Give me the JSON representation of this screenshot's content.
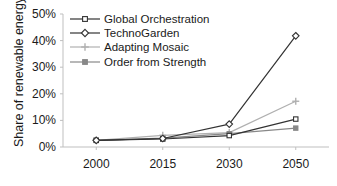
{
  "chart_data": {
    "type": "line",
    "title": "",
    "xlabel": "",
    "ylabel": "Share of renewable energy",
    "categories": [
      "2000",
      "2015",
      "2030",
      "2050"
    ],
    "ylim": [
      0,
      50
    ],
    "yticks": [
      "0%",
      "10%",
      "20%",
      "30%",
      "40%",
      "50%"
    ],
    "ytick_values": [
      0,
      10,
      20,
      30,
      40,
      50
    ],
    "grid": false,
    "legend_position": "top-left",
    "series": [
      {
        "name": "Global Orchestration",
        "marker": "open-square",
        "color": "#333333",
        "values": [
          2.5,
          3.0,
          4.3,
          10.5
        ]
      },
      {
        "name": "TechnoGarden",
        "marker": "open-diamond",
        "color": "#333333",
        "values": [
          2.5,
          3.2,
          8.6,
          41.8
        ]
      },
      {
        "name": "Adapting Mosaic",
        "marker": "plus",
        "color": "#b0b0b0",
        "values": [
          2.5,
          4.4,
          5.4,
          17.2
        ]
      },
      {
        "name": "Order from Strength",
        "marker": "filled-square",
        "color": "#888888",
        "values": [
          2.5,
          3.3,
          5.0,
          7.1
        ]
      }
    ]
  },
  "axis": {
    "axis_color": "#bfbfbf",
    "tick_color": "#bfbfbf"
  }
}
